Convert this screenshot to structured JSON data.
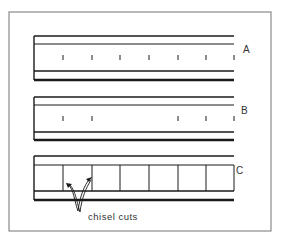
{
  "diagram": {
    "frame": {
      "x": 9,
      "y": 12,
      "width": 262,
      "height": 219,
      "stroke": "#8a8a8a"
    },
    "line_color": "#1a1a1a",
    "boards": [
      {
        "label": "A",
        "top": 36,
        "inner_top": 44,
        "inner_bottom": 71,
        "bottom": 80,
        "marks": [
          63,
          92,
          120,
          149,
          178,
          206,
          234
        ],
        "kind": "ticks"
      },
      {
        "label": "B",
        "top": 97,
        "inner_top": 105,
        "inner_bottom": 132,
        "bottom": 140,
        "marks": [
          63,
          92,
          178,
          206,
          234
        ],
        "kind": "ticks"
      },
      {
        "label": "C",
        "top": 156,
        "inner_top": 165,
        "inner_bottom": 191,
        "bottom": 200,
        "marks": [
          63,
          92,
          120,
          149,
          178,
          206,
          234
        ],
        "kind": "cuts"
      }
    ],
    "annotation": {
      "text": "chisel cuts"
    }
  }
}
